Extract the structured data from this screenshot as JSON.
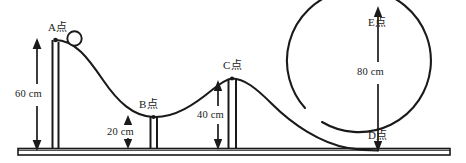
{
  "figure": {
    "type": "physics-diagram",
    "background_color": "#ffffff",
    "line_color": "#1a1a1a"
  },
  "points": {
    "a": {
      "label": "A点",
      "name": "point-a"
    },
    "b": {
      "label": "B点",
      "name": "point-b"
    },
    "c": {
      "label": "C点",
      "name": "point-c"
    },
    "d": {
      "label": "D点",
      "name": "point-d"
    },
    "e": {
      "label": "E点",
      "name": "point-e"
    }
  },
  "dimensions": {
    "a_height": "60 cm",
    "b_height": "20 cm",
    "c_height": "40 cm",
    "e_height": "80 cm"
  },
  "elements": {
    "ball": "ball",
    "ground": "ground-rail",
    "post_a": "support-post-a",
    "post_b": "support-post-b",
    "post_c": "support-post-c",
    "loop": "vertical-loop",
    "track": "track-curve"
  }
}
